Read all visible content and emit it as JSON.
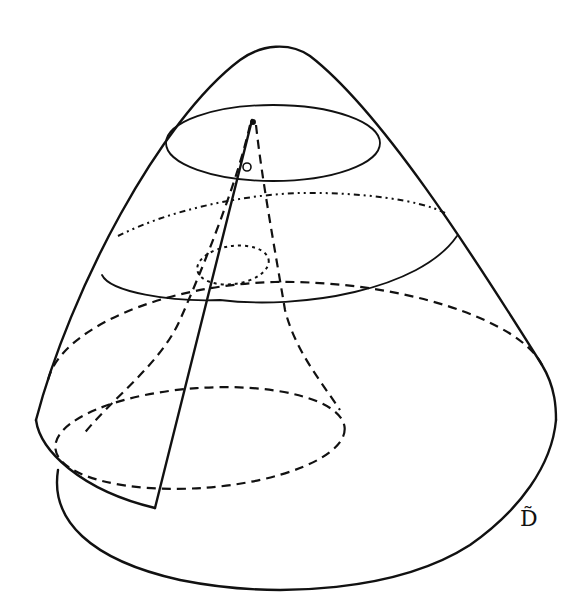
{
  "figure": {
    "label": "D̃",
    "stroke_color": "#111111",
    "background_color": "#ffffff",
    "elements": [
      {
        "name": "outer-surface",
        "style": "solid"
      },
      {
        "name": "top-cross-section",
        "style": "solid"
      },
      {
        "name": "upper-back-cross-section",
        "style": "dash-dot"
      },
      {
        "name": "middle-cross-section-front",
        "style": "solid"
      },
      {
        "name": "inner-small-loop",
        "style": "dotted"
      },
      {
        "name": "lower-cross-section",
        "style": "dashed"
      },
      {
        "name": "inner-base-ellipse",
        "style": "dashed"
      },
      {
        "name": "inner-funnel",
        "style": "dashed"
      },
      {
        "name": "cut-sheet",
        "style": "solid"
      },
      {
        "name": "base-outline",
        "style": "solid"
      }
    ]
  }
}
